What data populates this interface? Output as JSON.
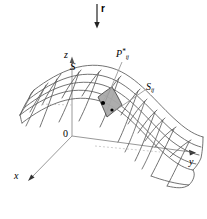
{
  "figure": {
    "kind": "surface-integral-diagram",
    "background_color": "#ffffff",
    "line_color": "#4a4a4a",
    "axis_color": "#777777",
    "patch_fill_color": "#a9a9a9",
    "patch_stroke_color": "#555555",
    "dot_color": "#000000",
    "leader_color": "#8a8a8a"
  },
  "labels": {
    "vector_r": "r",
    "axis_z": "z",
    "axis_y": "y",
    "axis_x": "x",
    "origin": "0",
    "surface": "S",
    "patch_base": "S",
    "patch_sub": "ij",
    "point_base": "P",
    "point_sup": "*",
    "point_sub": "ij"
  },
  "geometry": {
    "origin_px": [
      72,
      136
    ],
    "z_axis_tip_px": [
      72,
      57
    ],
    "y_axis_tip_px": [
      196,
      153
    ],
    "x_axis_tip_px": [
      28,
      180
    ],
    "r_arrow": {
      "x": 97,
      "y_start": 4,
      "y_end": 28
    },
    "patch_center_px": [
      110,
      108
    ],
    "dots_px": [
      [
        103,
        104
      ],
      [
        113,
        112
      ]
    ],
    "mesh_columns": 7,
    "mesh_rows": 5
  }
}
